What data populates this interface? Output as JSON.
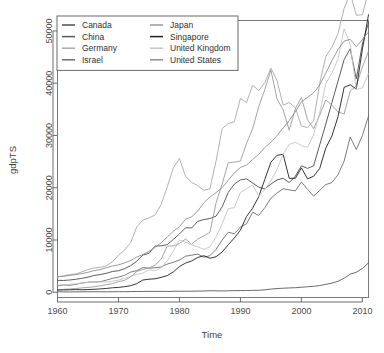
{
  "chart_data": {
    "type": "line",
    "title": "",
    "xlabel": "Time",
    "ylabel": "gdpTS",
    "xlim": [
      1960,
      2011
    ],
    "ylim": [
      -1000,
      52000
    ],
    "xticks": [
      1960,
      1970,
      1980,
      1990,
      2000,
      2010
    ],
    "xticklabels": [
      "1960",
      "1970",
      "1980",
      "1990",
      "2000",
      "2010"
    ],
    "yticks": [
      0,
      10000,
      20000,
      30000,
      40000,
      50000
    ],
    "yticklabels": [
      "0",
      "10000",
      "20000",
      "30000",
      "40000",
      "50000"
    ],
    "grid": false,
    "legend_position": "top-left",
    "legend_columns": 2,
    "x": [
      1960,
      1961,
      1962,
      1963,
      1964,
      1965,
      1966,
      1967,
      1968,
      1969,
      1970,
      1971,
      1972,
      1973,
      1974,
      1975,
      1976,
      1977,
      1978,
      1979,
      1980,
      1981,
      1982,
      1983,
      1984,
      1985,
      1986,
      1987,
      1988,
      1989,
      1990,
      1991,
      1992,
      1993,
      1994,
      1995,
      1996,
      1997,
      1998,
      1999,
      2000,
      2001,
      2002,
      2003,
      2004,
      2005,
      2006,
      2007,
      2008,
      2009,
      2010,
      2011
    ],
    "series": [
      {
        "name": "Canada",
        "color": "#4c4c4c",
        "values": [
          2294,
          2254,
          2354,
          2480,
          2670,
          2899,
          3217,
          3387,
          3623,
          3971,
          4122,
          4509,
          5079,
          5938,
          7128,
          7448,
          8838,
          8896,
          9117,
          10109,
          11169,
          12340,
          12310,
          13580,
          13920,
          14120,
          14560,
          16340,
          19100,
          20700,
          21500,
          21700,
          20900,
          20100,
          19800,
          20700,
          21500,
          21800,
          21000,
          22200,
          24200,
          23700,
          24200,
          28200,
          32200,
          36300,
          40400,
          44500,
          46600,
          40800,
          47500,
          51600
        ],
        "note": "thick dark gray"
      },
      {
        "name": "China",
        "color": "#5a5a5a",
        "values": [
          92,
          76,
          70,
          74,
          85,
          98,
          104,
          96,
          92,
          100,
          113,
          118,
          131,
          157,
          160,
          178,
          165,
          185,
          156,
          184,
          195,
          197,
          203,
          225,
          251,
          294,
          282,
          252,
          284,
          311,
          317,
          333,
          366,
          377,
          473,
          610,
          709,
          781,
          829,
          873,
          959,
          1053,
          1149,
          1289,
          1509,
          1753,
          2099,
          2694,
          3468,
          3832,
          4560,
          5618
        ],
        "note": "lowest line, flat then rising"
      },
      {
        "name": "Germany",
        "color": "#a8a8a8",
        "values": [
          2861,
          3144,
          3398,
          3512,
          3912,
          4327,
          4659,
          4761,
          5059,
          5833,
          7050,
          8100,
          9500,
          12500,
          13800,
          14200,
          14800,
          16800,
          20200,
          23800,
          25600,
          22200,
          21000,
          20400,
          19500,
          19800,
          25100,
          31300,
          32300,
          32600,
          37100,
          36300,
          39600,
          38600,
          40100,
          42900,
          40500,
          35800,
          36300,
          35300,
          31800,
          31500,
          32800,
          40000,
          45100,
          46900,
          49500,
          54300,
          57200,
          53000,
          53100,
          57600
        ],
        "note": "light gray, high in 1995 then dip"
      },
      {
        "name": "Israel",
        "color": "#6d6d6d",
        "values": [
          1229,
          1401,
          1340,
          1530,
          1750,
          1930,
          1990,
          2010,
          2320,
          2660,
          2890,
          3250,
          3860,
          4140,
          4720,
          4620,
          4700,
          4840,
          5400,
          5740,
          6170,
          6900,
          7100,
          7300,
          6700,
          7000,
          8200,
          10000,
          11500,
          11200,
          12500,
          13100,
          15300,
          14700,
          16200,
          18000,
          19000,
          19800,
          19600,
          19400,
          21100,
          19700,
          18400,
          19500,
          20600,
          21000,
          22500,
          25100,
          29700,
          27300,
          30000,
          33700
        ],
        "note": "medium gray lower-mid band"
      },
      {
        "name": "Japan",
        "color": "#9a9a9a",
        "values": [
          479,
          564,
          634,
          718,
          836,
          920,
          1059,
          1232,
          1451,
          1669,
          2035,
          2279,
          2947,
          3976,
          4354,
          4660,
          5198,
          6338,
          8821,
          8894,
          9309,
          10200,
          9200,
          10200,
          10800,
          11500,
          17100,
          20700,
          24800,
          24900,
          25100,
          28500,
          31300,
          35500,
          38800,
          42500,
          37000,
          34900,
          31000,
          35100,
          37300,
          33000,
          31300,
          33900,
          36800,
          35800,
          34500,
          34100,
          38500,
          39500,
          43100,
          46100
        ],
        "note": "sharp peak at 1995 ~42500"
      },
      {
        "name": "Singapore",
        "color": "#1f1f1f",
        "values": [
          428,
          449,
          472,
          512,
          477,
          516,
          573,
          640,
          731,
          856,
          926,
          1071,
          1264,
          1650,
          2342,
          2500,
          2582,
          2846,
          3194,
          3902,
          4928,
          5589,
          5993,
          6661,
          7000,
          6500,
          6800,
          7700,
          9100,
          10400,
          11900,
          14500,
          16100,
          18300,
          21600,
          24900,
          26200,
          26400,
          21800,
          21800,
          23800,
          21700,
          22200,
          23700,
          27600,
          29900,
          33600,
          39200,
          39700,
          38900,
          46500,
          53100
        ],
        "note": "darkest line, reaches highest at 2011"
      },
      {
        "name": "United Kingdom",
        "color": "#c4c4c4",
        "values": [
          1380,
          1452,
          1513,
          1613,
          1768,
          1874,
          1977,
          1998,
          1953,
          2100,
          2348,
          2650,
          3030,
          3426,
          3664,
          4299,
          4138,
          4694,
          6033,
          7884,
          10000,
          9600,
          9100,
          8700,
          8200,
          8700,
          10600,
          13100,
          16000,
          16200,
          19100,
          19800,
          20500,
          18400,
          19700,
          21300,
          23500,
          26400,
          28300,
          28700,
          28100,
          27700,
          30100,
          34400,
          39900,
          42000,
          44600,
          50400,
          47400,
          38800,
          39100,
          41900
        ],
        "note": "lightest gray, high mid-90s"
      },
      {
        "name": "United States",
        "color": "#8f8f8f",
        "values": [
          3007,
          3067,
          3244,
          3375,
          3574,
          3828,
          4146,
          4336,
          4696,
          5032,
          5247,
          5609,
          6094,
          6726,
          7226,
          7801,
          8592,
          9453,
          10565,
          11674,
          12575,
          13976,
          14434,
          15544,
          17121,
          18237,
          19071,
          20039,
          21417,
          22857,
          23889,
          24342,
          25419,
          26387,
          27695,
          28691,
          29968,
          31459,
          32854,
          34515,
          36450,
          37274,
          38166,
          39677,
          41922,
          44308,
          46437,
          48062,
          48401,
          47002,
          48374,
          49800
        ],
        "note": "mid-light gray steady rise"
      }
    ]
  }
}
